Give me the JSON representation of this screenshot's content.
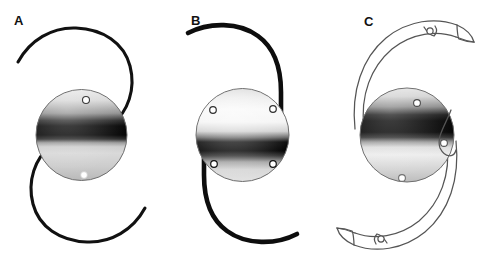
{
  "figure": {
    "background_color": "#ffffff",
    "width": 487,
    "height": 266,
    "panel_count": 3
  },
  "panels": [
    {
      "id": "A",
      "label": "A",
      "name": "Modified C-loop haptic IOL",
      "haptic_style": "thin filament closed C-loop",
      "haptic_color": "#111111",
      "haptic_filled": true,
      "optic_holes": 2,
      "optic_hole_positions": [
        "superior",
        "inferior"
      ],
      "optic_fill": "vertical gradient with dark band",
      "symmetry": "180-degree rotational"
    },
    {
      "id": "B",
      "label": "B",
      "name": "J-loop haptic IOL",
      "haptic_style": "thick J-loop",
      "haptic_color": "#0d0d0d",
      "haptic_filled": true,
      "optic_holes": 4,
      "optic_hole_positions": [
        "superior-nasal",
        "superior-temporal",
        "inferior-nasal",
        "inferior-temporal"
      ],
      "optic_fill": "vertical gradient with dark band",
      "symmetry": "180-degree rotational"
    },
    {
      "id": "C",
      "label": "C",
      "name": "Plate-outline broad haptic IOL",
      "haptic_style": "broad outlined plate haptic",
      "haptic_color": "#555555",
      "haptic_filled": false,
      "optic_holes": 3,
      "optic_hole_positions": [
        "superior",
        "mid-temporal",
        "inferior"
      ],
      "haptic_tip_holes": 2,
      "optic_fill": "vertical gradient with dark band",
      "symmetry": "180-degree rotational"
    }
  ],
  "colors": {
    "ink": "#111111",
    "outline": "#555555",
    "optic_edge": "#6e6e6e",
    "optic_light": "#f2f2f2",
    "optic_mid": "#9a9a9a",
    "optic_dark": "#050505",
    "background": "#ffffff"
  }
}
